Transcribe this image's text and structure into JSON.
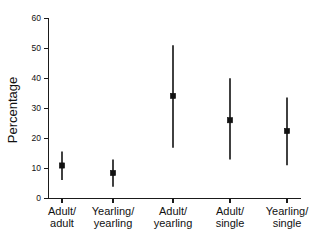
{
  "chart_data": {
    "type": "scatter",
    "title": "",
    "xlabel": "",
    "ylabel": "Percentage",
    "ylim": [
      0,
      60
    ],
    "yticks": [
      0,
      10,
      20,
      30,
      40,
      50,
      60
    ],
    "grid": false,
    "legend": null,
    "error_type": "confidence-interval",
    "categories": [
      "Adult/\nadult",
      "Yearling/\nyearling",
      "Adult/\nyearling",
      "Adult/\nsingle",
      "Yearling/\nsingle"
    ],
    "category_lines": [
      [
        "Adult/",
        "adult"
      ],
      [
        "Yearling/",
        "yearling"
      ],
      [
        "Adult/",
        "yearling"
      ],
      [
        "Adult/",
        "single"
      ],
      [
        "Yearling/",
        "single"
      ]
    ],
    "values": [
      11.0,
      8.5,
      34.2,
      26.1,
      22.5
    ],
    "error_low": [
      6.2,
      3.9,
      16.9,
      13.0,
      11.1
    ],
    "error_high": [
      15.7,
      13.0,
      51.1,
      40.1,
      33.7
    ],
    "series": [
      {
        "name": "Percentage",
        "points": [
          {
            "category": "Adult/adult",
            "value": 11.0,
            "low": 6.2,
            "high": 15.7
          },
          {
            "category": "Yearling/yearling",
            "value": 8.5,
            "low": 3.9,
            "high": 13.0
          },
          {
            "category": "Adult/yearling",
            "value": 34.2,
            "low": 16.9,
            "high": 51.1
          },
          {
            "category": "Adult/single",
            "value": 26.1,
            "low": 13.0,
            "high": 40.1
          },
          {
            "category": "Yearling/single",
            "value": 22.5,
            "low": 11.1,
            "high": 33.7
          }
        ]
      }
    ],
    "colors": {
      "marker": "#111111",
      "errorbar": "#111111",
      "axis": "#1a1a1a",
      "background": "#ffffff"
    }
  },
  "axis": {
    "y_label": "Percentage",
    "y_tick_labels": [
      "0",
      "10",
      "20",
      "30",
      "40",
      "50",
      "60"
    ]
  },
  "xlabels": [
    {
      "line1": "Adult/",
      "line2": "adult"
    },
    {
      "line1": "Yearling/",
      "line2": "yearling"
    },
    {
      "line1": "Adult/",
      "line2": "yearling"
    },
    {
      "line1": "Adult/",
      "line2": "single"
    },
    {
      "line1": "Yearling/",
      "line2": "single"
    }
  ]
}
